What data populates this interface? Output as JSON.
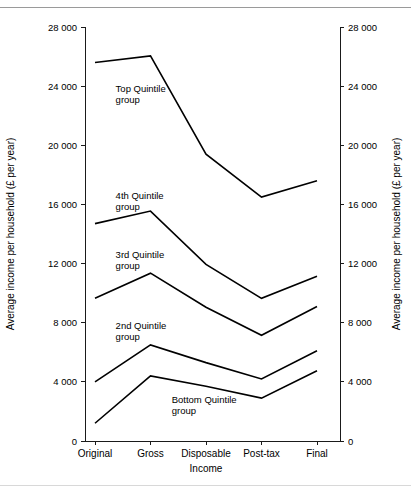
{
  "chart_data": {
    "type": "line",
    "title": "",
    "subtitle": "",
    "xlabel": "Income",
    "ylabel": "Average income per household (£ per year)",
    "ylabel_right": "Average income per household (£ per year)",
    "categories": [
      "Original",
      "Gross",
      "Disposable",
      "Post-tax",
      "Final"
    ],
    "ylim": [
      0,
      28000
    ],
    "yticks": [
      0,
      4000,
      8000,
      12000,
      16000,
      20000,
      24000,
      28000
    ],
    "ytick_labels": [
      "0",
      "4 000",
      "8 000",
      "12 000",
      "16 000",
      "20 000",
      "24 000",
      "28 000"
    ],
    "grid": false,
    "legend": "inline-annotations",
    "legend_position": "in-plot",
    "series": [
      {
        "name": "Top Quintile group",
        "label_line1": "Top Quintile",
        "label_line2": "group",
        "label_x": 0.12,
        "label_y": 23600,
        "values": [
          25600,
          26050,
          19400,
          16500,
          17600
        ]
      },
      {
        "name": "4th Quintile group",
        "label_line1": "4th Quintile",
        "label_line2": "group",
        "label_x": 0.12,
        "label_y": 16400,
        "values": [
          14700,
          15550,
          11950,
          9650,
          11150
        ]
      },
      {
        "name": "3rd Quintile group",
        "label_line1": "3rd Quintile",
        "label_line2": "group",
        "label_x": 0.12,
        "label_y": 12400,
        "values": [
          9650,
          11350,
          9050,
          7150,
          9100
        ]
      },
      {
        "name": "2nd Quintile group",
        "label_line1": "2nd Quintile",
        "label_line2": "group",
        "label_x": 0.12,
        "label_y": 7600,
        "values": [
          4000,
          6500,
          5300,
          4200,
          6100
        ]
      },
      {
        "name": "Bottom Quintile group",
        "label_line1": "Bottom Quintile",
        "label_line2": "group",
        "label_x": 0.34,
        "label_y": 2550,
        "values": [
          1200,
          4400,
          3700,
          2900,
          4750
        ]
      }
    ]
  },
  "colors": {
    "line": "#000000",
    "axis": "#1a1a1a",
    "background": "#ffffff",
    "rule_top": "#9a9a9a",
    "rule_bottom": "#d8d8d8"
  }
}
